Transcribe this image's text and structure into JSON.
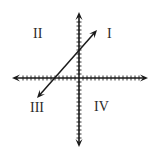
{
  "diagram": {
    "type": "coordinate-plane",
    "axes": {
      "origin": [
        79,
        78
      ],
      "x_axis": {
        "from": [
          12,
          78
        ],
        "to": [
          148,
          78
        ],
        "tick_spacing": 4,
        "arrows": "both"
      },
      "y_axis": {
        "from": [
          79,
          12
        ],
        "to": [
          79,
          147
        ],
        "tick_spacing": 4,
        "arrows": "both"
      },
      "tick_half_length": 2.5,
      "color": "#1a1a1a"
    },
    "line": {
      "from": [
        37,
        98
      ],
      "to": [
        97,
        30
      ],
      "arrows": "both",
      "color": "#1a1a1a"
    },
    "quadrant_labels": [
      {
        "id": "quadrant-1",
        "text": "I",
        "x": 107,
        "y": 27
      },
      {
        "id": "quadrant-2",
        "text": "II",
        "x": 33,
        "y": 27
      },
      {
        "id": "quadrant-3",
        "text": "III",
        "x": 30,
        "y": 101
      },
      {
        "id": "quadrant-4",
        "text": "IV",
        "x": 94,
        "y": 100
      }
    ]
  }
}
